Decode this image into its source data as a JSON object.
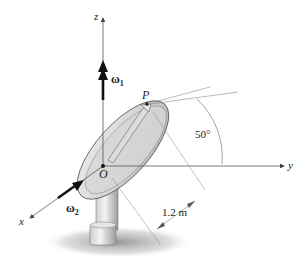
{
  "figure": {
    "axes": {
      "x": "x",
      "y": "y",
      "z": "z"
    },
    "origin": "O",
    "point": "P",
    "omega1": {
      "symbol": "ω",
      "sub": "1"
    },
    "omega2": {
      "symbol": "ω",
      "sub": "2"
    },
    "angle_label": "50°",
    "length_label": "1.2 m",
    "colors": {
      "line": "#555555",
      "dish": "#c8c8c8",
      "shadow": "#9a9a9a"
    }
  }
}
